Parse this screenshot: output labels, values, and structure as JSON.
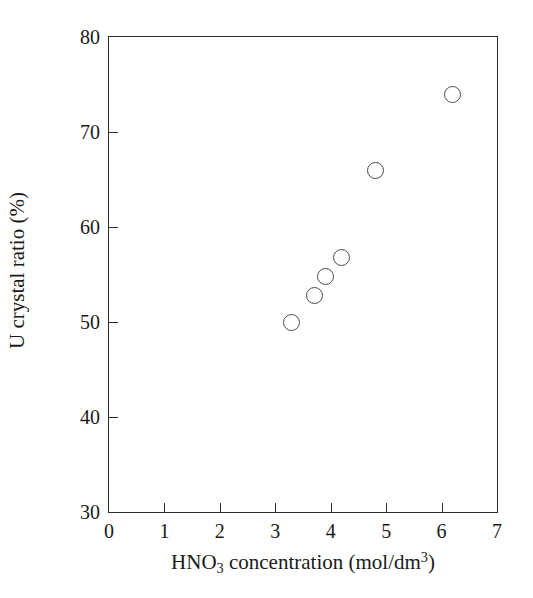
{
  "chart_data": {
    "type": "scatter",
    "title": "",
    "xlabel": "HNO3 concentration (mol/dm3)",
    "ylabel": "U crystal ratio (%)",
    "xlim": [
      0,
      7
    ],
    "ylim": [
      30,
      80
    ],
    "xticks": [
      0,
      1,
      2,
      3,
      4,
      5,
      6,
      7
    ],
    "yticks": [
      30,
      40,
      50,
      60,
      70,
      80
    ],
    "xtick_labels": [
      "0",
      "1",
      "2",
      "3",
      "4",
      "5",
      "6",
      "7"
    ],
    "ytick_labels": [
      "30",
      "40",
      "50",
      "60",
      "70",
      "80"
    ],
    "grid": false,
    "legend": null,
    "marker": "open-circle",
    "marker_color": "#4a4a4a",
    "series": [
      {
        "name": "U crystal ratio",
        "points": [
          {
            "x": 3.3,
            "y": 50.0
          },
          {
            "x": 3.7,
            "y": 52.8
          },
          {
            "x": 3.9,
            "y": 54.8
          },
          {
            "x": 4.2,
            "y": 56.8
          },
          {
            "x": 4.8,
            "y": 66.0
          },
          {
            "x": 6.2,
            "y": 73.9
          }
        ]
      }
    ]
  },
  "axis_titles": {
    "x": {
      "base1": "HNO",
      "sub1": "3",
      "base2": " concentration (mol/dm",
      "sup1": "3",
      "base3": ")"
    },
    "y": {
      "text": "U crystal ratio (%)"
    }
  }
}
